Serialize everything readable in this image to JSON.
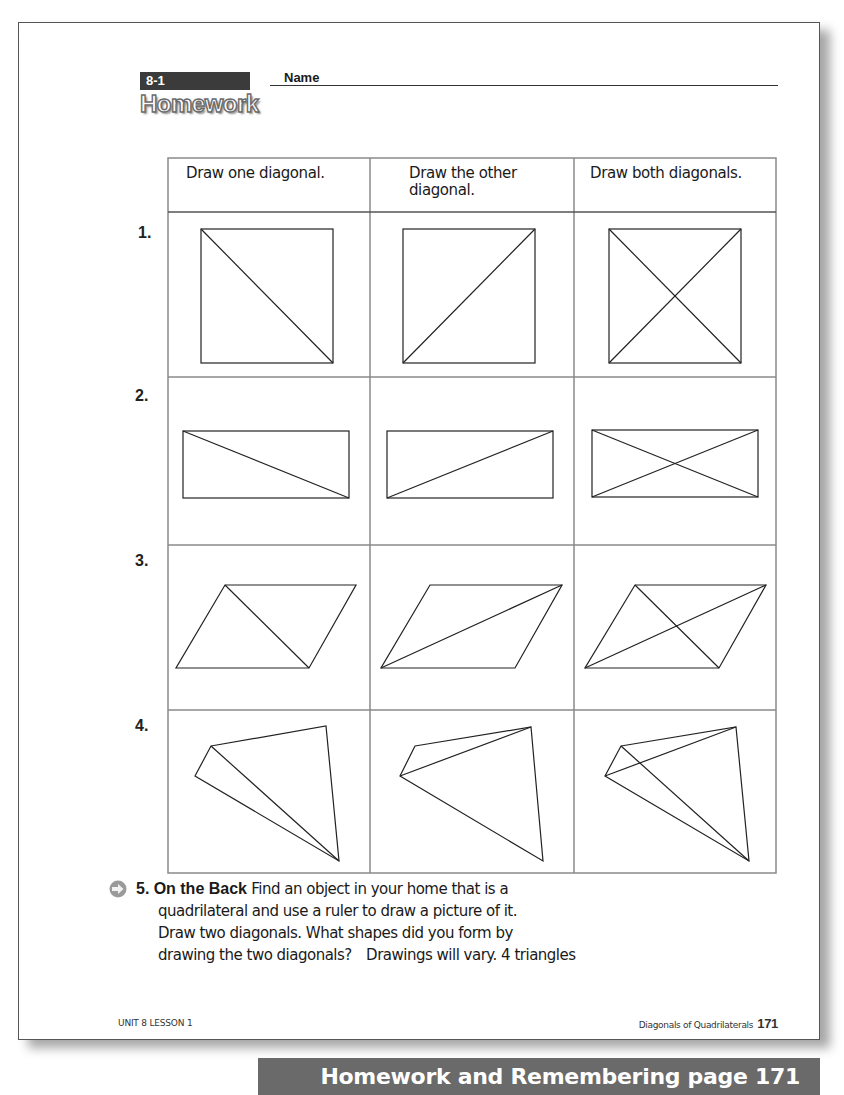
{
  "header": {
    "lesson_tag": "8-1",
    "name_label": "Name",
    "section_title": "Homework"
  },
  "table": {
    "columns": [
      "Draw one diagonal.",
      "Draw the other diagonal.",
      "Draw both diagonals."
    ],
    "column_lines": [
      [
        "Draw one diagonal."
      ],
      [
        "Draw the other",
        "diagonal."
      ],
      [
        "Draw both diagonals."
      ]
    ],
    "rows": [
      {
        "number": "1.",
        "shape": "square"
      },
      {
        "number": "2.",
        "shape": "rectangle"
      },
      {
        "number": "3.",
        "shape": "parallelogram"
      },
      {
        "number": "4.",
        "shape": "irregular quadrilateral"
      }
    ]
  },
  "question5": {
    "icon": "arrow-right-icon",
    "number": "5.",
    "title": "On the Back",
    "line1": "Find an object in your home that is a",
    "line2": "quadrilateral and use a ruler to draw a picture of it.",
    "line3": "Draw two diagonals. What shapes did you form by",
    "line4": "drawing the two diagonals?",
    "answer": "Drawings will vary. 4 triangles"
  },
  "footer": {
    "left": "UNIT 8 LESSON 1",
    "right": "Diagonals of Quadrilaterals",
    "page_number": "171"
  },
  "banner": {
    "text": "Homework and Remembering page 171"
  }
}
